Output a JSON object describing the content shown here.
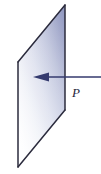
{
  "figure": {
    "type": "physics-diagram",
    "canvas": {
      "width": 101,
      "height": 174,
      "background": "#ffffff"
    },
    "labels": {
      "point_label": "P"
    },
    "colors": {
      "plane_fill_dark": "#9aa0c4",
      "plane_fill_light": "#fbfcfe",
      "plane_edge": "#2b2b3d",
      "arrow": "#343a6e",
      "label_text": "#25243a",
      "background": "#ffffff"
    },
    "shapes": {
      "plane": {
        "name": "plane-surface",
        "kind": "parallelogram",
        "points": "18,62 65,5 65,110 18,167"
      },
      "arrow": {
        "name": "incident-arrow",
        "kind": "arrow-left",
        "line_start_x": 101,
        "line_end_x": 47,
        "tip_x": 33,
        "y": 77,
        "stroke_width": 1.6,
        "head_half_height": 4.2
      },
      "label_position": {
        "x": 76,
        "y": 97
      }
    }
  }
}
